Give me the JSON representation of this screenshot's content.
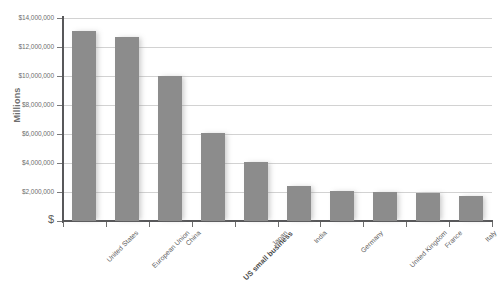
{
  "chart_data": {
    "type": "bar",
    "title": "",
    "xlabel": "",
    "ylabel": "Millions",
    "categories": [
      "United States",
      "European Union",
      "China",
      "US small business",
      "Japan",
      "India",
      "Germany",
      "United Kingdom",
      "France",
      "Italy"
    ],
    "values": [
      13100000,
      12700000,
      10000000,
      6100000,
      4100000,
      2400000,
      2100000,
      2000000,
      1900000,
      1700000
    ],
    "emphasized_category": "US small business",
    "ylim": [
      0,
      14000000
    ],
    "ytick_values": [
      0,
      2000000,
      4000000,
      6000000,
      8000000,
      10000000,
      12000000,
      14000000
    ],
    "ytick_labels": [
      "$",
      "$2,000,000",
      "$4,000,000",
      "$6,000,000",
      "$8,000,000",
      "$10,000,000",
      "$12,000,000",
      "$14,000,000"
    ],
    "grid": true,
    "legend": false,
    "legend_position": "none",
    "bar_color": "#8c8c8c",
    "gridline_color": "#d2d2d2",
    "axis_color": "#58585a",
    "label_color": "#6d6d6d",
    "background_color": "#ffffff"
  }
}
